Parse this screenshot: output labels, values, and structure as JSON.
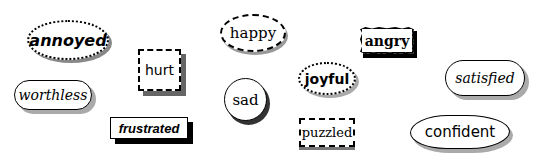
{
  "labels": {
    "annoyed": {
      "text": "annoyed",
      "shape": "dotted-ellipse"
    },
    "hurt": {
      "text": "hurt",
      "shape": "dash-dot-box"
    },
    "worthless": {
      "text": "worthless",
      "shape": "rounded-pill"
    },
    "frustrated": {
      "text": "frustrated",
      "shape": "rectangle-black-shadow"
    },
    "happy": {
      "text": "happy",
      "shape": "dashed-ellipse"
    },
    "sad": {
      "text": "sad",
      "shape": "circle"
    },
    "joyful": {
      "text": "joyful",
      "shape": "dotted-ellipse"
    },
    "angry": {
      "text": "angry",
      "shape": "jagged-box"
    },
    "puzzled": {
      "text": "puzzled",
      "shape": "dashed-box"
    },
    "satisfied": {
      "text": "satisfied",
      "shape": "rounded-pill"
    },
    "confident": {
      "text": "confident",
      "shape": "irregular-blob"
    }
  }
}
